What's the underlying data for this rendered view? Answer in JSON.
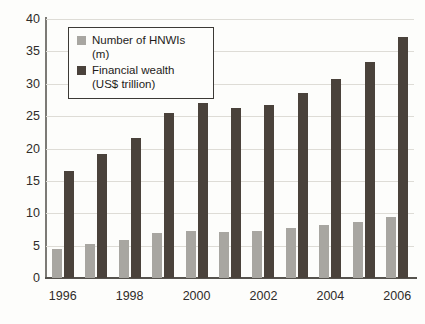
{
  "chart_data": {
    "type": "bar",
    "title": "",
    "subtitle": "",
    "xlabel": "",
    "ylabel": "",
    "ylim": [
      0,
      40
    ],
    "ytick_step": 5,
    "grid": true,
    "legend_position": "top-left",
    "categories": [
      "1996",
      "1997",
      "1998",
      "1999",
      "2000",
      "2001",
      "2002",
      "2003",
      "2004",
      "2005",
      "2006"
    ],
    "xtick_labels": [
      "1996",
      "1998",
      "2000",
      "2002",
      "2004",
      "2006"
    ],
    "yticks": [
      "0",
      "5",
      "10",
      "15",
      "20",
      "25",
      "30",
      "35",
      "40"
    ],
    "series": [
      {
        "name": "Number of HNWIs (m)",
        "color": "#a8a6a1",
        "values": [
          4.5,
          5.2,
          5.9,
          7.0,
          7.2,
          7.1,
          7.3,
          7.7,
          8.2,
          8.7,
          9.5
        ]
      },
      {
        "name": "Financial wealth (US$ trillion)",
        "color": "#4a423b",
        "values": [
          16.6,
          19.1,
          21.6,
          25.5,
          27.0,
          26.2,
          26.7,
          28.5,
          30.7,
          33.4,
          37.2
        ]
      }
    ]
  },
  "legend": {
    "entries": [
      {
        "label": "Number of HNWIs (m)"
      },
      {
        "label": "Financial wealth"
      },
      {
        "label": "(US$ trillion)"
      }
    ]
  }
}
